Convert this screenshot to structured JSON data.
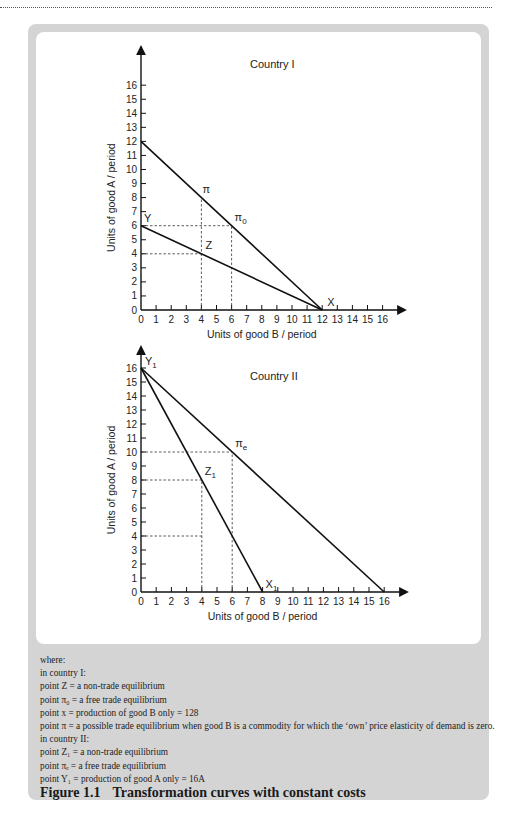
{
  "chart_data": [
    {
      "type": "line",
      "title": "Country I",
      "xlabel": "Units of good B / period",
      "ylabel": "Units of good A / period",
      "xlim": [
        0,
        16
      ],
      "ylim": [
        0,
        16
      ],
      "x_ticks": [
        0,
        1,
        2,
        3,
        4,
        5,
        6,
        7,
        8,
        9,
        10,
        11,
        12,
        13,
        14,
        15,
        16
      ],
      "y_ticks": [
        0,
        1,
        2,
        3,
        4,
        5,
        6,
        7,
        8,
        9,
        10,
        11,
        12,
        13,
        14,
        15,
        16
      ],
      "grid": false,
      "series": [
        {
          "name": "Transformation curve (Y–X)",
          "x": [
            0,
            12
          ],
          "y": [
            6,
            0
          ]
        },
        {
          "name": "Trade line (12A–X)",
          "x": [
            0,
            12
          ],
          "y": [
            12,
            0
          ]
        }
      ],
      "points": [
        {
          "label": "Y",
          "x": 0,
          "y": 6
        },
        {
          "label": "Z",
          "x": 4,
          "y": 4
        },
        {
          "label": "π",
          "x": 4,
          "y": 8
        },
        {
          "label": "π0",
          "x": 6,
          "y": 6
        },
        {
          "label": "X",
          "x": 12,
          "y": 0
        }
      ],
      "guides": [
        {
          "from": [
            0,
            6
          ],
          "to": [
            6,
            6
          ],
          "style": "dashed"
        },
        {
          "from": [
            0,
            4
          ],
          "to": [
            4,
            4
          ],
          "style": "dashed"
        },
        {
          "from": [
            4,
            0
          ],
          "to": [
            4,
            8
          ],
          "style": "dashed"
        },
        {
          "from": [
            6,
            0
          ],
          "to": [
            6,
            6
          ],
          "style": "dashed"
        }
      ]
    },
    {
      "type": "line",
      "title": "Country II",
      "xlabel": "Units of good B / period",
      "ylabel": "Units of good A / period",
      "xlim": [
        0,
        16
      ],
      "ylim": [
        0,
        16
      ],
      "x_ticks": [
        0,
        1,
        2,
        3,
        4,
        5,
        6,
        7,
        8,
        9,
        10,
        11,
        12,
        13,
        14,
        15,
        16
      ],
      "y_ticks": [
        0,
        1,
        2,
        3,
        4,
        5,
        6,
        7,
        8,
        9,
        10,
        11,
        12,
        13,
        14,
        15,
        16
      ],
      "grid": false,
      "series": [
        {
          "name": "Transformation curve (Y1–X1)",
          "x": [
            0,
            8
          ],
          "y": [
            16,
            0
          ]
        },
        {
          "name": "Trade line (Y1–16B)",
          "x": [
            0,
            16
          ],
          "y": [
            16,
            0
          ]
        }
      ],
      "points": [
        {
          "label": "Y1",
          "x": 0,
          "y": 16
        },
        {
          "label": "Z1",
          "x": 4,
          "y": 8
        },
        {
          "label": "πe",
          "x": 6,
          "y": 10
        },
        {
          "label": "X1",
          "x": 8,
          "y": 0
        }
      ],
      "guides": [
        {
          "from": [
            0,
            10
          ],
          "to": [
            6,
            10
          ],
          "style": "dashed"
        },
        {
          "from": [
            0,
            8
          ],
          "to": [
            4,
            8
          ],
          "style": "dashed"
        },
        {
          "from": [
            0,
            4
          ],
          "to": [
            4,
            4
          ],
          "style": "dashed"
        },
        {
          "from": [
            4,
            0
          ],
          "to": [
            4,
            8
          ],
          "style": "dashed"
        },
        {
          "from": [
            6,
            0
          ],
          "to": [
            6,
            10
          ],
          "style": "dashed"
        }
      ]
    }
  ],
  "charts": {
    "c1": {
      "title": "Country I",
      "xlabel": "Units of good B / period",
      "ylabel": "Units of good A / period",
      "labels": {
        "Y": "Y",
        "Z": "Z",
        "pi": "π",
        "pi0": "π",
        "pi0_sub": "0",
        "X": "X"
      }
    },
    "c2": {
      "title": "Country II",
      "xlabel": "Units of good B / period",
      "ylabel": "Units of good A / period",
      "labels": {
        "Y1": "Y",
        "Y1_sub": "1",
        "Z1": "Z",
        "Z1_sub": "1",
        "pie": "π",
        "pie_sub": "e",
        "X1": "X",
        "X1_sub": "1"
      }
    }
  },
  "caption": {
    "lines": [
      "where:",
      "in country I:",
      "point Z = a non-trade equilibrium",
      "point π₀ = a free trade equilibrium",
      "point x = production of good B only = 128",
      "point π = a possible trade equilibrium when good B is a commodity for which the ‘own’ price elasticity of demand is zero.",
      "in country II:",
      "point Z₁ = a non-trade equilibrium",
      "point πₑ = a free trade equilibrium",
      "point Y₁ = production of good A only = 16A"
    ],
    "figure_number": "Figure 1.1",
    "figure_title": "Transformation curves with constant costs"
  }
}
